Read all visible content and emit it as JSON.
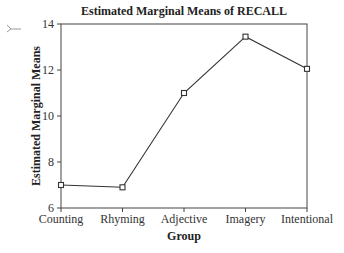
{
  "chart_data": {
    "type": "line",
    "title": "Estimated Marginal Means of RECALL",
    "xlabel": "Group",
    "ylabel": "Estimated Marginal Means",
    "categories": [
      "Counting",
      "Rhyming",
      "Adjective",
      "Imagery",
      "Intentional"
    ],
    "series": [
      {
        "name": "RECALL",
        "values": [
          7.0,
          6.9,
          11.0,
          13.45,
          12.05
        ]
      }
    ],
    "ylim": [
      6,
      14
    ],
    "yticks": [
      6,
      8,
      10,
      12,
      14
    ],
    "grid": false,
    "legend": "none",
    "marker": "square",
    "line_color": "#333333"
  },
  "title": "Estimated Marginal Means of RECALL",
  "xlabel": "Group",
  "ylabel": "Estimated Marginal Means",
  "margin_mark": "Y"
}
